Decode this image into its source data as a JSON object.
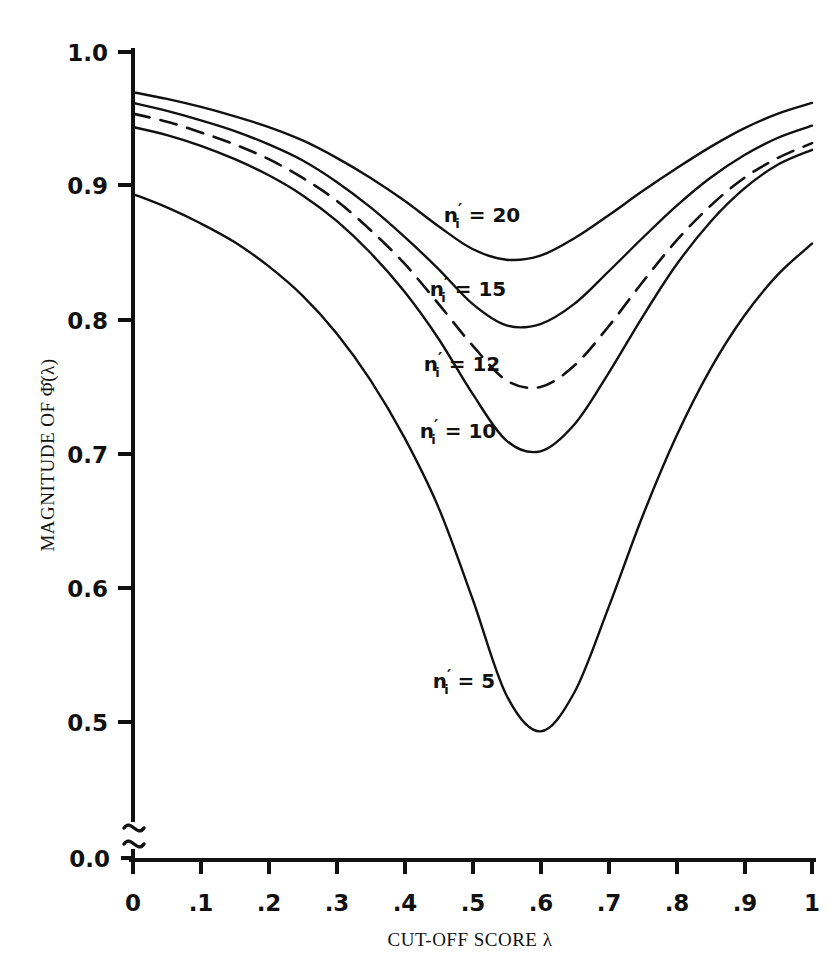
{
  "figure": {
    "background_color": "#ffffff",
    "ink_color": "#111111"
  },
  "axes": {
    "y_title": "MAGNITUDE OF Φ̂(λ)",
    "y_title_plain": "MAGNITUDE OF PHI-HAT(lambda)",
    "x_title": "CUT-OFF SCORE λ",
    "x_title_plain": "CUT-OFF SCORE lambda",
    "y_ticks": [
      "1.0",
      "0.9",
      "0.8",
      "0.7",
      "0.6",
      "0.5",
      "0.0"
    ],
    "x_ticks": [
      "0",
      ".1",
      ".2",
      ".3",
      ".4",
      ".5",
      ".6",
      ".7",
      ".8",
      ".9",
      "1"
    ],
    "y_axis_break": true,
    "y_axis_break_note": "axis break between 0.5 and 0.0"
  },
  "curve_labels": [
    {
      "id": "n20",
      "prefix": "n",
      "sub": "i",
      "prime": "′",
      "text": "n′ᵢ = 20",
      "value": "20",
      "x": 482,
      "y": 222
    },
    {
      "id": "n15",
      "prefix": "n",
      "sub": "i",
      "prime": "′",
      "text": "n′ᵢ = 15",
      "value": "15",
      "x": 468,
      "y": 296
    },
    {
      "id": "n12",
      "prefix": "n",
      "sub": "i",
      "prime": "′",
      "text": "n′ᵢ = 12",
      "value": "12",
      "x": 462,
      "y": 371
    },
    {
      "id": "n10",
      "prefix": "n",
      "sub": "i",
      "prime": "′",
      "text": "n′ᵢ = 10",
      "value": "10",
      "x": 458,
      "y": 438
    },
    {
      "id": "n5",
      "prefix": "n",
      "sub": "i",
      "prime": "′",
      "text": "n′ᵢ = 5",
      "value": "5",
      "x": 464,
      "y": 688
    }
  ],
  "chart_data": {
    "type": "line",
    "title": "",
    "xlabel": "CUT-OFF SCORE λ",
    "ylabel": "MAGNITUDE OF Φ̂(λ)",
    "xlim": [
      0,
      1
    ],
    "ylim": [
      0.5,
      1.0
    ],
    "y_axis_break": "between 0.5 and 0.0",
    "grid": false,
    "legend": "inline curve labels",
    "x": [
      0.0,
      0.05,
      0.1,
      0.15,
      0.2,
      0.25,
      0.3,
      0.35,
      0.4,
      0.45,
      0.5,
      0.55,
      0.6,
      0.65,
      0.7,
      0.75,
      0.8,
      0.85,
      0.9,
      0.95,
      1.0
    ],
    "series": [
      {
        "name": "n'i = 20",
        "n": 20,
        "style": "solid",
        "values": [
          0.97,
          0.965,
          0.959,
          0.952,
          0.944,
          0.934,
          0.921,
          0.906,
          0.889,
          0.87,
          0.853,
          0.845,
          0.848,
          0.861,
          0.878,
          0.896,
          0.913,
          0.929,
          0.943,
          0.954,
          0.962
        ],
        "minimum": {
          "x": 0.55,
          "y": 0.845
        }
      },
      {
        "name": "n'i = 15",
        "n": 15,
        "style": "solid",
        "values": [
          0.962,
          0.956,
          0.949,
          0.941,
          0.931,
          0.919,
          0.903,
          0.884,
          0.862,
          0.838,
          0.812,
          0.796,
          0.797,
          0.812,
          0.836,
          0.861,
          0.885,
          0.906,
          0.923,
          0.936,
          0.945
        ],
        "minimum": {
          "x": 0.55,
          "y": 0.795
        }
      },
      {
        "name": "n'i = 12",
        "n": 12,
        "style": "dashed",
        "values": [
          0.954,
          0.948,
          0.94,
          0.931,
          0.92,
          0.906,
          0.889,
          0.867,
          0.842,
          0.812,
          0.781,
          0.755,
          0.75,
          0.766,
          0.795,
          0.828,
          0.859,
          0.885,
          0.906,
          0.921,
          0.932
        ],
        "minimum": {
          "x": 0.575,
          "y": 0.748
        }
      },
      {
        "name": "n'i = 10",
        "n": 10,
        "style": "solid",
        "values": [
          0.944,
          0.938,
          0.93,
          0.92,
          0.908,
          0.893,
          0.874,
          0.85,
          0.821,
          0.786,
          0.745,
          0.71,
          0.702,
          0.722,
          0.76,
          0.802,
          0.841,
          0.873,
          0.898,
          0.916,
          0.927
        ],
        "minimum": {
          "x": 0.565,
          "y": 0.7
        }
      },
      {
        "name": "n'i = 5",
        "n": 5,
        "style": "solid",
        "values": [
          0.894,
          0.884,
          0.872,
          0.858,
          0.84,
          0.818,
          0.79,
          0.755,
          0.712,
          0.66,
          0.592,
          0.52,
          0.493,
          0.522,
          0.585,
          0.653,
          0.713,
          0.763,
          0.803,
          0.834,
          0.857
        ],
        "minimum": {
          "x": 0.575,
          "y": 0.49
        }
      }
    ]
  }
}
